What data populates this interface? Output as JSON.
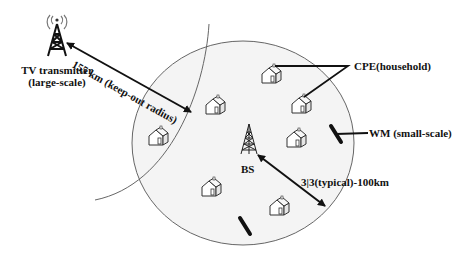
{
  "diagram": {
    "tv_transmitter": {
      "label_line1": "TV transmitter",
      "label_line2": "(large-scale)"
    },
    "keep_out": {
      "label": "155 km (keep-out radius)"
    },
    "base_station": {
      "label": "BS"
    },
    "cpe": {
      "label": "CPE(household)"
    },
    "wm": {
      "label": "WM (small-scale)"
    },
    "cell_radius": {
      "label": "3|3(typical)-100km"
    },
    "colors": {
      "line": "#111111",
      "circle_fill": "#f4f4f4",
      "circle_stroke": "#666666"
    }
  }
}
